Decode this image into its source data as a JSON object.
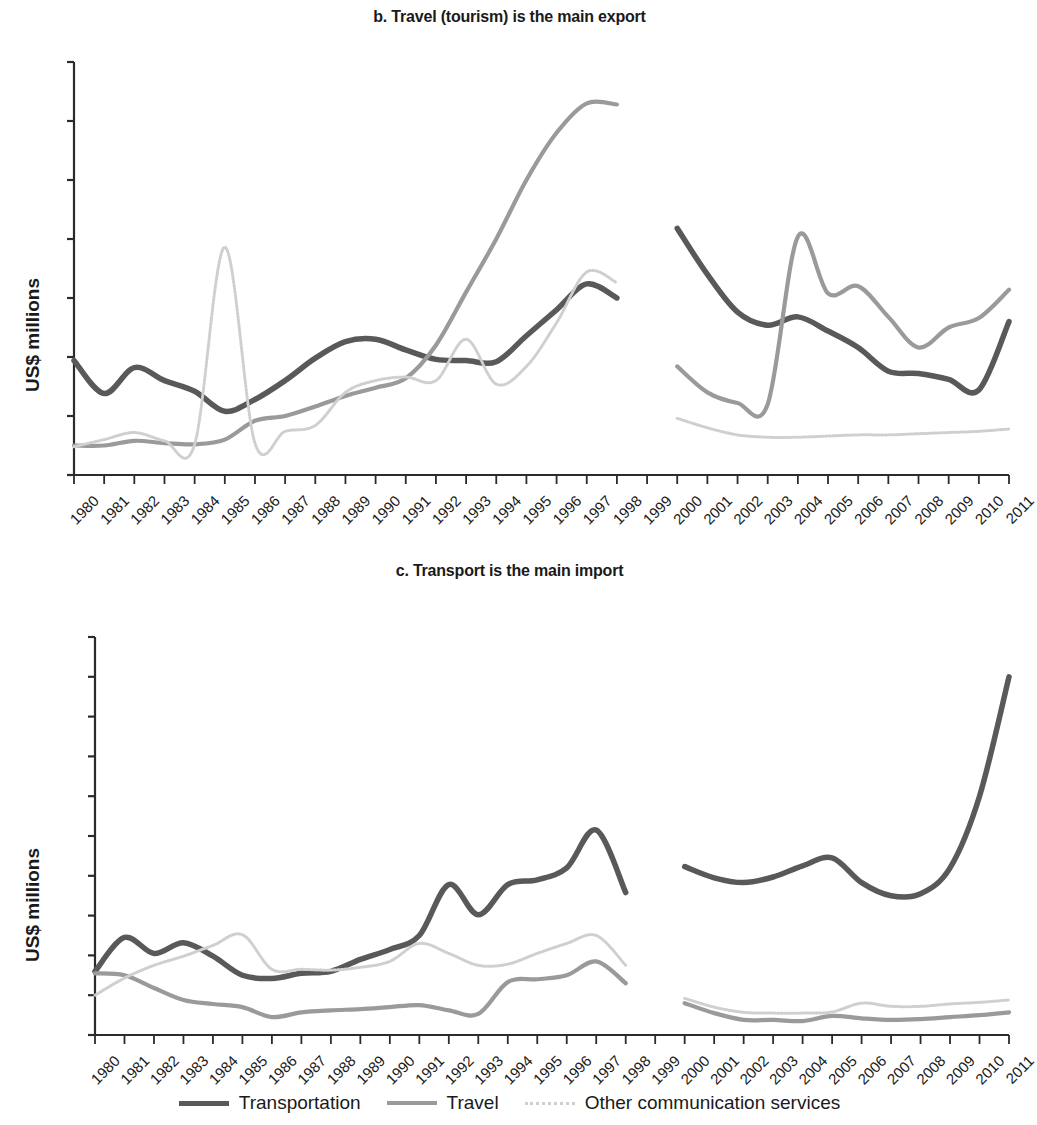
{
  "panels": {
    "b": {
      "title": "b. Travel (tourism) is the main export",
      "ylabel": "US$ millions"
    },
    "c": {
      "title": "c. Transport is the main import",
      "ylabel": "US$ millions"
    }
  },
  "legend": {
    "items": [
      {
        "label": "Transportation",
        "color": "#595959",
        "style": "solid-thick"
      },
      {
        "label": "Travel",
        "color": "#9a9a9a",
        "style": "solid-medium"
      },
      {
        "label": "Other communication services",
        "color": "#cfcfcf",
        "style": "dotted"
      }
    ]
  },
  "chart_data": [
    {
      "type": "line",
      "title": "b. Travel (tourism) is the main export",
      "xlabel": "",
      "ylabel": "US$ millions",
      "ylim": [
        0,
        350
      ],
      "yticks": [
        0,
        50,
        100,
        150,
        200,
        250,
        300,
        350
      ],
      "grid": false,
      "legend_position": "bottom",
      "categories": [
        1980,
        1981,
        1982,
        1983,
        1984,
        1985,
        1986,
        1987,
        1988,
        1989,
        1990,
        1991,
        1992,
        1993,
        1994,
        1995,
        1996,
        1997,
        1998,
        1999,
        2000,
        2001,
        2002,
        2003,
        2004,
        2005,
        2006,
        2007,
        2008,
        2009,
        2010,
        2011
      ],
      "series": [
        {
          "name": "Transportation",
          "color": "#595959",
          "values": [
            97,
            69,
            91,
            80,
            71,
            54,
            64,
            80,
            99,
            113,
            115,
            106,
            98,
            97,
            96,
            118,
            140,
            162,
            150,
            null,
            209,
            170,
            138,
            127,
            134,
            122,
            108,
            88,
            86,
            81,
            72,
            130
          ]
        },
        {
          "name": "Travel",
          "color": "#9a9a9a",
          "values": [
            25,
            25,
            29,
            27,
            26,
            30,
            46,
            50,
            58,
            67,
            74,
            82,
            110,
            155,
            200,
            250,
            290,
            315,
            314,
            null,
            92,
            70,
            61,
            60,
            202,
            154,
            160,
            134,
            108,
            125,
            133,
            157
          ]
        },
        {
          "name": "Other communication services",
          "color": "#cfcfcf",
          "values": [
            24,
            30,
            36,
            29,
            26,
            193,
            27,
            37,
            42,
            70,
            80,
            83,
            80,
            115,
            77,
            92,
            129,
            172,
            163,
            null,
            48,
            40,
            34,
            32,
            32,
            33,
            34,
            34,
            35,
            36,
            37,
            39
          ]
        }
      ]
    },
    {
      "type": "line",
      "title": "c. Transport is the main import",
      "xlabel": "",
      "ylabel": "US$ millions",
      "ylim": [
        0,
        1000
      ],
      "yticks": [
        0,
        100,
        200,
        300,
        400,
        500,
        600,
        700,
        800,
        900,
        1000
      ],
      "grid": false,
      "legend_position": "bottom",
      "categories": [
        1980,
        1981,
        1982,
        1983,
        1984,
        1985,
        1986,
        1987,
        1988,
        1989,
        1990,
        1991,
        1992,
        1993,
        1994,
        1995,
        1996,
        1997,
        1998,
        1999,
        2000,
        2001,
        2002,
        2003,
        2004,
        2005,
        2006,
        2007,
        2008,
        2009,
        2010,
        2011
      ],
      "series": [
        {
          "name": "Transportation",
          "color": "#595959",
          "values": [
            160,
            245,
            205,
            232,
            198,
            150,
            142,
            155,
            160,
            190,
            215,
            250,
            378,
            302,
            378,
            390,
            420,
            515,
            358,
            null,
            423,
            395,
            383,
            397,
            425,
            445,
            383,
            350,
            355,
            420,
            600,
            900
          ]
        },
        {
          "name": "Travel",
          "color": "#9a9a9a",
          "values": [
            155,
            150,
            118,
            88,
            78,
            70,
            45,
            57,
            62,
            65,
            70,
            75,
            62,
            53,
            133,
            140,
            150,
            185,
            130,
            null,
            80,
            55,
            38,
            38,
            35,
            48,
            42,
            38,
            40,
            45,
            50,
            57
          ]
        },
        {
          "name": "Other communication services",
          "color": "#cfcfcf",
          "values": [
            100,
            143,
            175,
            198,
            225,
            252,
            165,
            165,
            163,
            170,
            185,
            230,
            205,
            175,
            178,
            205,
            230,
            250,
            175,
            null,
            92,
            70,
            57,
            55,
            55,
            58,
            80,
            72,
            72,
            78,
            82,
            88
          ]
        }
      ]
    }
  ]
}
